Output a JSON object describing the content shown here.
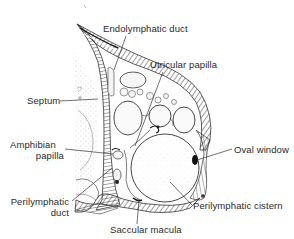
{
  "figure": {
    "colors": {
      "background": "#ffffff",
      "ink": "#2a2a2a",
      "tissue": "#6e6e6e",
      "stipple": "#b8b8b8",
      "dark_spot": "#1a1a1a"
    }
  },
  "labels": {
    "endolymphatic_duct": "Endolymphatic duct",
    "utricular_papilla": "Utricular papilla",
    "septum": "Septum",
    "amphibian_papilla_line1": "Amphibian",
    "amphibian_papilla_line2": "papilla",
    "oval_window": "Oval window",
    "perilymphatic_duct_line1": "Perilymphatic",
    "perilymphatic_duct_line2": "duct",
    "perilymphatic_cistern": "Perilymphatic cistern",
    "saccular_macula": "Saccular macula"
  }
}
